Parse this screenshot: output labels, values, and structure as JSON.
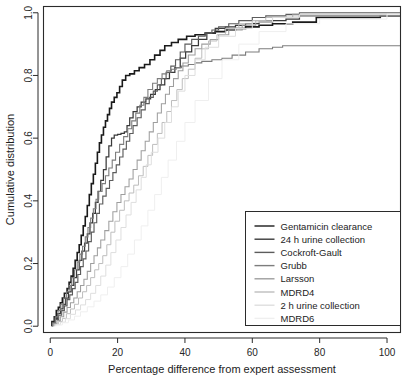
{
  "chart_data": {
    "type": "line",
    "title": "",
    "subtitle": "",
    "xlabel": "Percentage difference from expert assessment",
    "ylabel": "Cumulative distribution",
    "xlim": [
      -2,
      104
    ],
    "ylim": [
      -0.02,
      1.02
    ],
    "xticks": [
      0,
      20,
      40,
      60,
      80,
      100
    ],
    "yticks": [
      0.0,
      0.2,
      0.4,
      0.6,
      0.8,
      1.0
    ],
    "xtick_labels": [
      "0",
      "20",
      "40",
      "60",
      "80",
      "100"
    ],
    "ytick_labels": [
      "0.0",
      "0.2",
      "0.4",
      "0.6",
      "0.8",
      "1.0"
    ],
    "grid": false,
    "step_type": "hv",
    "legend_position": "bottom-right",
    "annotations": [],
    "series": [
      {
        "name": "Gentamicin clearance",
        "color": "#1a1a1a",
        "width": 1.6,
        "x": [
          0.5,
          1.2,
          1.8,
          2.4,
          3.0,
          3.6,
          4.2,
          5.0,
          5.6,
          6.2,
          6.8,
          7.4,
          8.0,
          8.6,
          9.2,
          9.8,
          10.4,
          11.0,
          11.6,
          12.2,
          12.8,
          13.4,
          14.0,
          14.6,
          15.2,
          15.8,
          16.4,
          17.0,
          17.6,
          18.2,
          19.0,
          19.8,
          20.6,
          21.4,
          22.4,
          23.6,
          25.0,
          26.4,
          28.0,
          29.6,
          31.0,
          32.6,
          34.0,
          36.0,
          38.0,
          40.5,
          43.0,
          46.0,
          49.0,
          52.0,
          55.0,
          58.0,
          62.0,
          66.0,
          72.0,
          79.0,
          98.0
        ],
        "y": [
          0.015,
          0.03,
          0.05,
          0.06,
          0.075,
          0.09,
          0.105,
          0.12,
          0.14,
          0.16,
          0.185,
          0.21,
          0.235,
          0.26,
          0.29,
          0.32,
          0.35,
          0.385,
          0.42,
          0.455,
          0.485,
          0.52,
          0.555,
          0.585,
          0.61,
          0.635,
          0.655,
          0.675,
          0.695,
          0.715,
          0.73,
          0.745,
          0.765,
          0.785,
          0.8,
          0.805,
          0.815,
          0.825,
          0.835,
          0.85,
          0.865,
          0.88,
          0.895,
          0.905,
          0.915,
          0.925,
          0.93,
          0.935,
          0.94,
          0.945,
          0.95,
          0.955,
          0.96,
          0.965,
          0.97,
          0.985,
          0.99
        ]
      },
      {
        "name": "24 h urine collection",
        "color": "#3a3a3a",
        "width": 1.25,
        "x": [
          0.6,
          1.4,
          2.2,
          3.0,
          3.8,
          4.6,
          5.4,
          6.2,
          7.0,
          7.8,
          8.6,
          9.4,
          10.2,
          11.0,
          11.8,
          12.6,
          13.4,
          14.2,
          15.0,
          15.8,
          16.6,
          17.4,
          18.2,
          19.0,
          20.0,
          21.0,
          22.0,
          22.8,
          23.6,
          24.6,
          25.8,
          27.0,
          28.4,
          29.8,
          31.2,
          32.6,
          34.0,
          35.4,
          37.0,
          38.6,
          40.2,
          42.0,
          44.0,
          46.5,
          49.0,
          52.0,
          55.0,
          58.0,
          62.0,
          66.0,
          70.0,
          74.0
        ],
        "y": [
          0.012,
          0.025,
          0.04,
          0.055,
          0.07,
          0.09,
          0.11,
          0.13,
          0.155,
          0.18,
          0.21,
          0.24,
          0.265,
          0.295,
          0.33,
          0.36,
          0.395,
          0.43,
          0.465,
          0.5,
          0.54,
          0.575,
          0.6,
          0.61,
          0.612,
          0.615,
          0.62,
          0.64,
          0.665,
          0.685,
          0.7,
          0.715,
          0.725,
          0.74,
          0.755,
          0.77,
          0.79,
          0.81,
          0.825,
          0.855,
          0.875,
          0.895,
          0.915,
          0.935,
          0.95,
          0.955,
          0.96,
          0.965,
          0.97,
          0.975,
          0.98,
          0.99
        ]
      },
      {
        "name": "Cockroft-Gault",
        "color": "#5c5c5c",
        "width": 1.15,
        "x": [
          0.8,
          1.6,
          2.5,
          3.4,
          4.2,
          5.0,
          5.8,
          6.6,
          7.4,
          8.2,
          9.0,
          9.8,
          10.6,
          11.4,
          12.2,
          13.0,
          13.8,
          14.6,
          15.6,
          16.6,
          17.6,
          18.6,
          19.6,
          20.6,
          21.6,
          22.6,
          23.6,
          24.6,
          25.8,
          27.0,
          28.2,
          29.4,
          30.6,
          31.8,
          33.0,
          34.4,
          35.8,
          37.2,
          38.6,
          40.0,
          42.0,
          44.0,
          46.0,
          48.0,
          50.0,
          53.0,
          56.0,
          60.0,
          64.0,
          70.0,
          74.0
        ],
        "y": [
          0.01,
          0.022,
          0.035,
          0.05,
          0.065,
          0.085,
          0.1,
          0.12,
          0.14,
          0.165,
          0.19,
          0.215,
          0.24,
          0.27,
          0.3,
          0.33,
          0.36,
          0.39,
          0.415,
          0.44,
          0.465,
          0.49,
          0.515,
          0.54,
          0.565,
          0.59,
          0.615,
          0.64,
          0.665,
          0.69,
          0.71,
          0.73,
          0.75,
          0.77,
          0.79,
          0.81,
          0.83,
          0.85,
          0.875,
          0.9,
          0.915,
          0.925,
          0.935,
          0.945,
          0.955,
          0.965,
          0.975,
          0.985,
          0.99,
          0.995,
          1.0
        ]
      },
      {
        "name": "Grubb",
        "color": "#7d7d7d",
        "width": 1.1,
        "x": [
          0.7,
          1.5,
          2.3,
          3.1,
          4.0,
          4.8,
          5.6,
          6.4,
          7.2,
          8.0,
          8.8,
          9.6,
          10.4,
          11.2,
          12.0,
          12.8,
          13.6,
          14.4,
          15.4,
          16.4,
          17.4,
          18.4,
          19.4,
          20.6,
          21.8,
          23.0,
          24.2,
          25.4,
          26.6,
          27.8,
          29.0,
          30.4,
          31.8,
          33.2,
          34.6,
          36.0,
          37.4,
          39.0,
          41.0,
          43.0,
          45.0,
          48.0,
          51.0,
          54.0,
          58.0,
          62.0,
          66.0,
          69.0
        ],
        "y": [
          0.01,
          0.03,
          0.05,
          0.07,
          0.09,
          0.11,
          0.13,
          0.155,
          0.18,
          0.205,
          0.23,
          0.255,
          0.285,
          0.315,
          0.345,
          0.375,
          0.405,
          0.43,
          0.455,
          0.48,
          0.505,
          0.53,
          0.555,
          0.58,
          0.605,
          0.63,
          0.655,
          0.68,
          0.705,
          0.73,
          0.755,
          0.775,
          0.79,
          0.805,
          0.815,
          0.82,
          0.825,
          0.83,
          0.835,
          0.84,
          0.845,
          0.85,
          0.855,
          0.865,
          0.875,
          0.885,
          0.89,
          0.895
        ]
      },
      {
        "name": "Larsson",
        "color": "#9e9e9e",
        "width": 1.05,
        "x": [
          1.0,
          2.0,
          3.0,
          4.0,
          5.0,
          6.0,
          7.0,
          8.0,
          9.0,
          10.0,
          11.0,
          12.0,
          13.0,
          14.0,
          15.0,
          16.2,
          17.4,
          18.6,
          19.8,
          21.0,
          22.2,
          23.4,
          24.6,
          25.8,
          27.0,
          28.2,
          29.4,
          30.6,
          31.8,
          33.0,
          34.2,
          35.4,
          36.6,
          38.0,
          39.4,
          41.0,
          43.0,
          45.0,
          47.5,
          50.0,
          53.0,
          57.0,
          61.0,
          66.0,
          72.0
        ],
        "y": [
          0.008,
          0.018,
          0.03,
          0.045,
          0.06,
          0.075,
          0.09,
          0.11,
          0.13,
          0.15,
          0.175,
          0.2,
          0.225,
          0.25,
          0.275,
          0.305,
          0.335,
          0.365,
          0.395,
          0.42,
          0.445,
          0.47,
          0.5,
          0.53,
          0.56,
          0.59,
          0.62,
          0.65,
          0.68,
          0.71,
          0.74,
          0.765,
          0.79,
          0.815,
          0.84,
          0.865,
          0.885,
          0.9,
          0.915,
          0.93,
          0.945,
          0.96,
          0.975,
          0.985,
          0.995
        ]
      },
      {
        "name": "MDRD4",
        "color": "#bdbdbd",
        "width": 1.0,
        "x": [
          1.2,
          2.4,
          3.6,
          4.8,
          6.0,
          7.2,
          8.4,
          9.6,
          10.8,
          12.0,
          13.2,
          14.4,
          15.6,
          16.8,
          18.0,
          19.2,
          20.6,
          22.0,
          23.4,
          24.8,
          26.2,
          27.6,
          29.0,
          30.4,
          31.8,
          33.2,
          34.6,
          36.0,
          37.6,
          39.2,
          41.0,
          43.0,
          45.0,
          47.0,
          49.5,
          52.0,
          56.0,
          60.0,
          64.0,
          70.0
        ],
        "y": [
          0.006,
          0.015,
          0.025,
          0.04,
          0.055,
          0.07,
          0.09,
          0.11,
          0.13,
          0.155,
          0.18,
          0.2,
          0.225,
          0.26,
          0.3,
          0.335,
          0.37,
          0.4,
          0.425,
          0.45,
          0.48,
          0.51,
          0.545,
          0.58,
          0.615,
          0.65,
          0.685,
          0.72,
          0.755,
          0.79,
          0.82,
          0.855,
          0.885,
          0.91,
          0.93,
          0.95,
          0.965,
          0.975,
          0.985,
          0.99
        ]
      },
      {
        "name": "2 h urine collection",
        "color": "#dedede",
        "width": 1.0,
        "x": [
          1.5,
          3.0,
          4.5,
          6.0,
          7.5,
          9.0,
          10.5,
          12.0,
          13.5,
          15.0,
          16.5,
          18.0,
          19.5,
          21.0,
          22.5,
          24.0,
          25.5,
          27.0,
          28.5,
          30.0,
          32.0,
          34.0,
          36.0,
          38.0,
          40.0,
          43.0,
          46.0,
          50.0,
          55.0,
          60.0,
          66.0,
          74.0
        ],
        "y": [
          0.005,
          0.013,
          0.024,
          0.038,
          0.052,
          0.068,
          0.085,
          0.105,
          0.13,
          0.16,
          0.195,
          0.235,
          0.275,
          0.315,
          0.355,
          0.395,
          0.435,
          0.475,
          0.515,
          0.555,
          0.6,
          0.65,
          0.7,
          0.75,
          0.8,
          0.85,
          0.89,
          0.925,
          0.95,
          0.97,
          0.985,
          0.995
        ]
      },
      {
        "name": "MDRD6",
        "color": "#efefef",
        "width": 1.0,
        "x": [
          1.8,
          3.6,
          5.4,
          7.2,
          9.0,
          11.0,
          13.0,
          15.0,
          17.0,
          19.0,
          21.0,
          23.0,
          25.0,
          27.0,
          29.0,
          31.0,
          33.0,
          35.0,
          37.5,
          40.0,
          43.0,
          47.0,
          51.0,
          56.0,
          62.0,
          70.0,
          80.0,
          100.0
        ],
        "y": [
          0.004,
          0.011,
          0.02,
          0.032,
          0.046,
          0.062,
          0.08,
          0.1,
          0.125,
          0.155,
          0.19,
          0.23,
          0.275,
          0.32,
          0.37,
          0.42,
          0.475,
          0.53,
          0.59,
          0.65,
          0.72,
          0.79,
          0.85,
          0.9,
          0.94,
          0.965,
          0.98,
          0.995
        ]
      }
    ]
  },
  "legend": {
    "entries": [
      {
        "label": "Gentamicin clearance"
      },
      {
        "label": "24 h urine collection"
      },
      {
        "label": "Cockroft-Gault"
      },
      {
        "label": "Grubb"
      },
      {
        "label": "Larsson"
      },
      {
        "label": "MDRD4"
      },
      {
        "label": "2 h urine collection"
      },
      {
        "label": "MDRD6"
      }
    ]
  }
}
